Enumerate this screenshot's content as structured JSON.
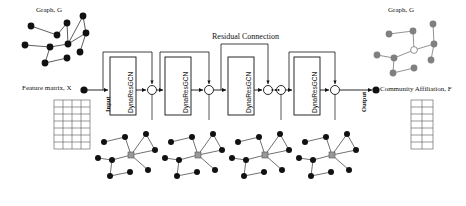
{
  "diagram": {
    "title_left_graph": "Graph, G",
    "title_right_graph": "Graph, G",
    "feature_matrix_label": "Feature matrix,  X",
    "community_label": "Community Affiliation, F",
    "residual_label": "Residual Connection",
    "input_label": "Input",
    "output_label": "Output",
    "ellipsis": "•••",
    "blocks": [
      {
        "label": "DynaResGCN"
      },
      {
        "label": "DynaResGCN"
      },
      {
        "label": "DynaResGCN"
      },
      {
        "label": "DynaResGCN"
      }
    ],
    "colors": {
      "node_black": "#111111",
      "node_gray": "#808080",
      "edge": "#333333",
      "stroke": "#111111",
      "grid_line": "#555555",
      "background": "#ffffff"
    },
    "feature_matrix_grid": {
      "cols": 4,
      "rows": 7
    },
    "output_matrix_grid": {
      "cols": 2,
      "rows": 7
    },
    "block_boxes": [
      {
        "x": 110,
        "y": 57,
        "w": 26,
        "h": 58
      },
      {
        "x": 165,
        "y": 57,
        "w": 26,
        "h": 58
      },
      {
        "x": 228,
        "y": 57,
        "w": 26,
        "h": 58
      },
      {
        "x": 294,
        "y": 57,
        "w": 26,
        "h": 58
      }
    ],
    "sum_nodes": [
      {
        "cx": 152,
        "cy": 90,
        "r": 4.5
      },
      {
        "cx": 209,
        "cy": 90,
        "r": 4.5
      },
      {
        "cx": 268,
        "cy": 90,
        "r": 4.5
      },
      {
        "cx": 281,
        "cy": 90,
        "r": 4.5
      },
      {
        "cx": 335,
        "cy": 90,
        "r": 4.5
      }
    ],
    "small_graphs": [
      {
        "cx": 130,
        "cy": 165
      },
      {
        "cx": 196,
        "cy": 165
      },
      {
        "cx": 263,
        "cy": 165
      },
      {
        "cx": 330,
        "cy": 165
      }
    ]
  }
}
